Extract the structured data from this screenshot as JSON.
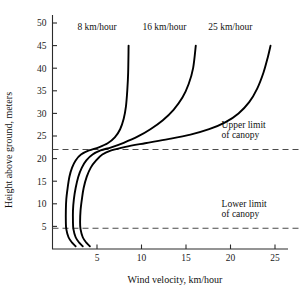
{
  "chart_data": {
    "type": "line",
    "title": "",
    "xlabel": "Wind velocity, km/hour",
    "ylabel": "Height above ground, meters",
    "xlim": [
      0,
      26.5
    ],
    "ylim": [
      0,
      51
    ],
    "xticks": [
      5,
      10,
      15,
      20,
      25
    ],
    "yticks": [
      5,
      10,
      15,
      20,
      25,
      30,
      35,
      40,
      45,
      50
    ],
    "xtick_labels": [
      "5",
      "10",
      "15",
      "20",
      "25"
    ],
    "ytick_labels": [
      "5",
      "10",
      "15",
      "20",
      "25",
      "30",
      "35",
      "40",
      "45",
      "50"
    ],
    "grid": false,
    "legend_position": "inline-curve-labels",
    "orientation": "vertical-profile",
    "series": [
      {
        "name": "8 km/hour",
        "label": "8 km/hour",
        "label_x": 2.8,
        "label_y": 48.5,
        "color": "#000000",
        "points": [
          [
            2.6,
            0.6
          ],
          [
            2.2,
            1.4
          ],
          [
            1.8,
            2.6
          ],
          [
            1.55,
            4.4
          ],
          [
            1.5,
            6.0
          ],
          [
            1.5,
            8.5
          ],
          [
            1.55,
            11.0
          ],
          [
            1.7,
            13.5
          ],
          [
            1.9,
            16.0
          ],
          [
            2.2,
            18.0
          ],
          [
            2.6,
            19.6
          ],
          [
            3.2,
            20.9
          ],
          [
            4.1,
            21.8
          ],
          [
            5.2,
            22.5
          ],
          [
            6.2,
            23.4
          ],
          [
            7.0,
            24.7
          ],
          [
            7.6,
            26.5
          ],
          [
            8.0,
            28.8
          ],
          [
            8.25,
            31.5
          ],
          [
            8.4,
            35.0
          ],
          [
            8.5,
            39.0
          ],
          [
            8.55,
            45.0
          ]
        ]
      },
      {
        "name": "16 km/hour",
        "label": "16 km/hour",
        "label_x": 10.1,
        "label_y": 48.5,
        "color": "#000000",
        "points": [
          [
            3.4,
            0.6
          ],
          [
            3.0,
            1.4
          ],
          [
            2.6,
            2.6
          ],
          [
            2.35,
            4.4
          ],
          [
            2.3,
            6.0
          ],
          [
            2.3,
            8.5
          ],
          [
            2.4,
            11.0
          ],
          [
            2.6,
            13.5
          ],
          [
            2.9,
            16.0
          ],
          [
            3.3,
            18.0
          ],
          [
            3.8,
            19.6
          ],
          [
            4.5,
            20.9
          ],
          [
            5.4,
            21.8
          ],
          [
            6.6,
            22.5
          ],
          [
            8.0,
            23.5
          ],
          [
            9.6,
            24.9
          ],
          [
            11.0,
            26.5
          ],
          [
            12.4,
            28.5
          ],
          [
            13.6,
            30.8
          ],
          [
            14.6,
            33.5
          ],
          [
            15.3,
            36.5
          ],
          [
            15.8,
            40.0
          ],
          [
            16.1,
            45.0
          ]
        ]
      },
      {
        "name": "25 km/hour",
        "label": "25 km/hour",
        "label_x": 17.5,
        "label_y": 48.5,
        "color": "#000000",
        "points": [
          [
            4.2,
            0.6
          ],
          [
            3.8,
            1.4
          ],
          [
            3.4,
            2.6
          ],
          [
            3.15,
            4.4
          ],
          [
            3.1,
            6.0
          ],
          [
            3.15,
            8.5
          ],
          [
            3.3,
            11.0
          ],
          [
            3.5,
            13.5
          ],
          [
            3.85,
            16.0
          ],
          [
            4.3,
            18.0
          ],
          [
            4.9,
            19.6
          ],
          [
            5.6,
            20.9
          ],
          [
            6.6,
            21.8
          ],
          [
            8.2,
            22.6
          ],
          [
            10.4,
            23.4
          ],
          [
            13.0,
            24.3
          ],
          [
            15.5,
            25.3
          ],
          [
            17.6,
            26.5
          ],
          [
            19.4,
            28.0
          ],
          [
            20.9,
            30.0
          ],
          [
            22.1,
            32.5
          ],
          [
            23.0,
            35.5
          ],
          [
            23.7,
            39.0
          ],
          [
            24.2,
            42.5
          ],
          [
            24.5,
            45.0
          ]
        ]
      }
    ],
    "reference_lines": [
      {
        "name": "upper-limit-of-canopy",
        "y": 22.0,
        "style": "dashed",
        "label_line1": "Upper limit",
        "label_line2": "of canopy",
        "label_x": 19.0,
        "label_y": 26.8
      },
      {
        "name": "lower-limit-of-canopy",
        "y": 4.6,
        "style": "dashed",
        "label_line1": "Lower limit",
        "label_line2": "of canopy",
        "label_x": 19.0,
        "label_y": 9.4
      }
    ]
  }
}
